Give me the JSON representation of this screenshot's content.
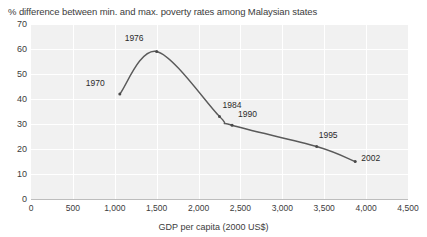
{
  "chart_data": {
    "type": "line",
    "title": "% difference between min. and max. poverty rates among Malaysian states",
    "xlabel": "GDP per capita (2000 US$)",
    "ylabel": "",
    "xlim": [
      0,
      4500
    ],
    "ylim": [
      0,
      70
    ],
    "grid": true,
    "legend": "none",
    "x_ticks": [
      "0",
      "500",
      "1,000",
      "1,500",
      "2,000",
      "2,500",
      "3,000",
      "3,500",
      "4,000",
      "4,500"
    ],
    "x_tick_values": [
      0,
      500,
      1000,
      1500,
      2000,
      2500,
      3000,
      3500,
      4000,
      4500
    ],
    "y_ticks": [
      "0",
      "10",
      "20",
      "30",
      "40",
      "50",
      "60",
      "70"
    ],
    "y_tick_values": [
      0,
      10,
      20,
      30,
      40,
      50,
      60,
      70
    ],
    "series": [
      {
        "name": "% difference between min. and max. poverty rates",
        "color": "#5a5a5a",
        "points": [
          {
            "label": "1970",
            "x": 1060,
            "y": 42,
            "label_dx": -34,
            "label_dy": -10
          },
          {
            "label": "1976",
            "x": 1500,
            "y": 59,
            "label_dx": -32,
            "label_dy": -13
          },
          {
            "label": "1984",
            "x": 2250,
            "y": 33,
            "label_dx": 3,
            "label_dy": -11
          },
          {
            "label": "1990",
            "x": 2400,
            "y": 29.5,
            "label_dx": 6,
            "label_dy": -10
          },
          {
            "label": "1995",
            "x": 3410,
            "y": 21,
            "label_dx": 2,
            "label_dy": -11
          },
          {
            "label": "2002",
            "x": 3870,
            "y": 15,
            "label_dx": 6,
            "label_dy": -3
          }
        ]
      }
    ]
  },
  "colors": {
    "plot_background": "#f1f1f1",
    "gridline": "#ffffff",
    "line": "#5a5a5a",
    "text": "#3c3c3c",
    "axis": "#bdbdbd"
  }
}
